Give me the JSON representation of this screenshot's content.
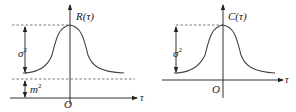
{
  "figures": [
    {
      "id": "autocorrelation",
      "y_label": "R(τ)",
      "x_label": "τ",
      "origin_label": "O",
      "annotations": [
        {
          "label": "σ",
          "superscript": "2",
          "meaning": "span from curve asymptote to peak"
        },
        {
          "label": "m",
          "superscript": "2",
          "meaning": "span from x-axis to asymptote"
        }
      ]
    },
    {
      "id": "autocovariance",
      "y_label": "C(τ)",
      "x_label": "τ",
      "origin_label": "O",
      "annotations": [
        {
          "label": "σ",
          "superscript": "2",
          "meaning": "span from x-axis to peak"
        }
      ]
    }
  ],
  "colors": {
    "line": "#333333",
    "background": "#ffffff"
  }
}
